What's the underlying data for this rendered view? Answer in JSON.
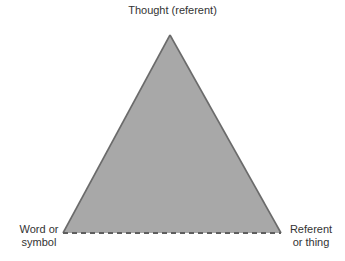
{
  "diagram": {
    "type": "triangle",
    "colors": {
      "fill": "#a8a8a8",
      "stroke": "#6b6b6b",
      "base_stroke": "#5e5e5e",
      "text": "#333333"
    },
    "nodes": {
      "top": {
        "label": "Thought (referent)"
      },
      "left": {
        "line1": "Word or",
        "line2": "symbol"
      },
      "right": {
        "line1": "Referent",
        "line2": "or thing"
      }
    },
    "edges": [
      {
        "from": "left",
        "to": "top",
        "style": "solid"
      },
      {
        "from": "top",
        "to": "right",
        "style": "solid"
      },
      {
        "from": "left",
        "to": "right",
        "style": "dashed"
      }
    ]
  }
}
